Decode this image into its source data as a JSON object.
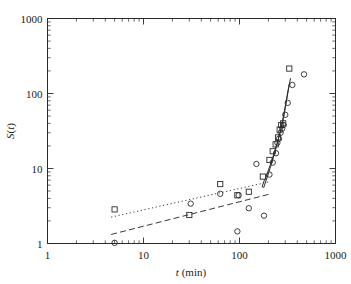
{
  "figure": {
    "name": "log-log-scatter-plot",
    "background": "#ffffff",
    "ink_color": "#2a2a2a"
  },
  "chart_data": {
    "type": "scatter",
    "title": "",
    "subtitle": "",
    "xlabel": "t (min)",
    "xlabel_italic_part": "t",
    "xlabel_rest": " (min)",
    "ylabel": "S(t)",
    "ylabel_italic_part": "S",
    "ylabel_rest": "(t)",
    "xscale": "log",
    "yscale": "log",
    "xlim": [
      1,
      1000
    ],
    "ylim": [
      1,
      1000
    ],
    "xticks": [
      1,
      10,
      100,
      1000
    ],
    "xticklabels": [
      "1",
      "10",
      "100",
      "1000"
    ],
    "yticks": [
      1,
      10,
      100,
      1000
    ],
    "yticklabels": [
      "1",
      "10",
      "100",
      "1000"
    ],
    "minor_ticks": true,
    "grid": false,
    "legend": "none",
    "series": [
      {
        "name": "squares",
        "marker": "open-square",
        "x": [
          5.0,
          30.0,
          63.0,
          95.0,
          125.0,
          175.0,
          205.0,
          222.0,
          238.0,
          252.0,
          262.0,
          272.0,
          285.0,
          330.0
        ],
        "y": [
          2.85,
          2.4,
          6.2,
          4.4,
          4.9,
          7.8,
          13.0,
          17.0,
          21.0,
          26.0,
          33.0,
          38.0,
          40.0,
          215.0
        ]
      },
      {
        "name": "circles",
        "marker": "open-circle",
        "x": [
          5.0,
          31.0,
          63.0,
          95.0,
          98.0,
          125.0,
          150.0,
          180.0,
          205.0,
          222.0,
          240.0,
          248.0,
          258.0,
          268.0,
          278.0,
          288.0,
          300.0,
          318.0,
          355.0,
          470.0
        ],
        "y": [
          1.02,
          3.4,
          4.6,
          1.45,
          4.4,
          2.95,
          11.5,
          2.35,
          8.3,
          12.0,
          16.0,
          22.0,
          25.0,
          30.0,
          34.0,
          38.0,
          52.0,
          75.0,
          130.0,
          180.0
        ]
      }
    ],
    "lines": [
      {
        "name": "solid-steep-fit",
        "style": "solid",
        "description": "Solid staircase curve tracing the steep upturn beyond t about 170 min",
        "x": [
          172,
          176,
          182,
          188,
          193,
          198,
          204,
          210,
          216,
          222,
          228,
          234,
          240,
          246,
          252,
          258,
          264,
          270,
          276,
          282,
          288,
          296,
          304,
          314,
          326,
          340
        ],
        "y": [
          5.6,
          6.3,
          7.0,
          7.5,
          8.3,
          9.2,
          10.2,
          11.3,
          12.6,
          14.0,
          15.6,
          17.3,
          19.2,
          21.4,
          23.8,
          26.5,
          29.5,
          33.0,
          37.0,
          42.0,
          48.0,
          58.0,
          72.0,
          92.0,
          120.0,
          160.0
        ]
      },
      {
        "name": "solid-steep-fit-second",
        "style": "solid",
        "description": "Second nearly parallel solid branch slightly to the left of the first",
        "x": [
          178,
          184,
          190,
          196,
          202,
          208,
          214,
          220,
          226,
          232,
          238,
          244,
          250,
          256,
          262,
          268,
          276,
          286,
          298,
          312,
          330
        ],
        "y": [
          5.5,
          6.2,
          7.0,
          7.9,
          8.9,
          10.0,
          11.2,
          12.6,
          14.2,
          16.0,
          18.0,
          20.3,
          22.9,
          25.8,
          29.1,
          32.8,
          39.0,
          49.0,
          65.0,
          90.0,
          135.0
        ]
      },
      {
        "name": "dotted-upper-trend",
        "style": "dotted",
        "description": "Upper dotted power-law trend line across the mid range",
        "x": [
          4.6,
          200
        ],
        "y": [
          2.25,
          6.6
        ]
      },
      {
        "name": "dashed-lower-trend",
        "style": "dashed",
        "description": "Lower long-dashed power-law trend line across the mid range",
        "x": [
          4.6,
          205
        ],
        "y": [
          1.32,
          4.55
        ]
      }
    ],
    "annotations": []
  }
}
